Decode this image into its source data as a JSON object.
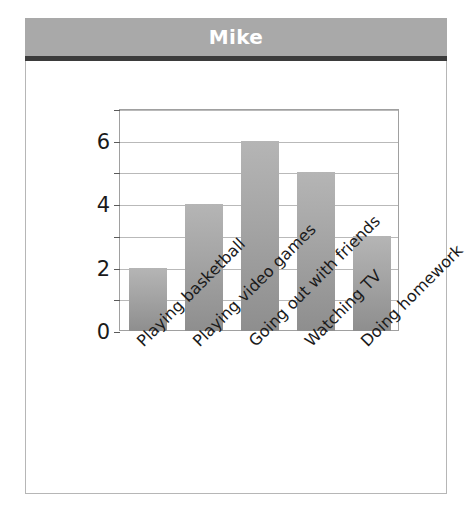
{
  "header": {
    "title": "Mike"
  },
  "colors": {
    "header_background": "#a9a9a9",
    "header_text": "#ffffff",
    "header_rule": "#3b3b3b",
    "panel_background": "#ffffff",
    "panel_border": "#b6b6b6",
    "bar_top": "#b5b5b5",
    "bar_bottom": "#8e8e8e",
    "gridline": "#b9b9b9",
    "axis": "#a0a0a0"
  },
  "chart_data": {
    "type": "bar",
    "title": "Mike",
    "xlabel": "",
    "ylabel": "Time (hours)",
    "categories": [
      "Playing basketball",
      "Playing video games",
      "Going out with friends",
      "Watching TV",
      "Doing homework"
    ],
    "values": [
      2,
      4,
      6,
      5,
      3
    ],
    "ylim": [
      0,
      7
    ],
    "ytick_labels": [
      "0",
      "2",
      "4",
      "6"
    ],
    "ytick_values": [
      0,
      2,
      4,
      6
    ],
    "gridline_values": [
      1,
      2,
      3,
      4,
      5,
      6
    ],
    "grid": true,
    "legend": "none",
    "xtick_rotation": 45
  }
}
